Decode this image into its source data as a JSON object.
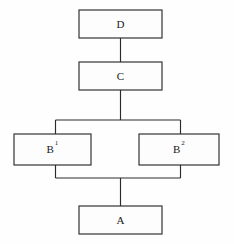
{
  "diagram": {
    "background_color": "#fefefe",
    "line_color": "#2b2b2b",
    "text_color": "#1a1a1a",
    "nodes": [
      {
        "id": "D",
        "label": "D",
        "superscript": "",
        "x": 79,
        "y": 10,
        "width": 83,
        "height": 28
      },
      {
        "id": "C",
        "label": "C",
        "superscript": "",
        "x": 79,
        "y": 62,
        "width": 83,
        "height": 28
      },
      {
        "id": "B1",
        "label": "B",
        "superscript": "1",
        "x": 14,
        "y": 134,
        "width": 77,
        "height": 31
      },
      {
        "id": "B2",
        "label": "B",
        "superscript": "2",
        "x": 139,
        "y": 134,
        "width": 80,
        "height": 31
      },
      {
        "id": "A",
        "label": "A",
        "superscript": "",
        "x": 79,
        "y": 206,
        "width": 83,
        "height": 28
      }
    ],
    "connectors": [
      {
        "name": "d-to-c",
        "from": "D",
        "to": "C",
        "path": "M 120.5 38 L 120.5 62"
      },
      {
        "name": "c-to-split",
        "from": "C",
        "to": "split-bar",
        "path": "M 120.5 90 L 120.5 120"
      },
      {
        "name": "split-bar-top",
        "from": "split-bar",
        "to": "B1-B2",
        "path": "M 55.5 120 L 180.5 120"
      },
      {
        "name": "split-left-down",
        "from": "split-bar",
        "to": "B1",
        "path": "M 55.5 120 L 55.5 134"
      },
      {
        "name": "split-right-down",
        "from": "split-bar",
        "to": "B2",
        "path": "M 180.5 120 L 180.5 134"
      },
      {
        "name": "merge-left-down",
        "from": "B1",
        "to": "merge-bar",
        "path": "M 55.5 165 L 55.5 178"
      },
      {
        "name": "merge-right-down",
        "from": "B2",
        "to": "merge-bar",
        "path": "M 180.5 165 L 180.5 178"
      },
      {
        "name": "merge-bar-bottom",
        "from": "B1-B2",
        "to": "merge-bar",
        "path": "M 55.5 178 L 180.5 178"
      },
      {
        "name": "merge-to-a",
        "from": "merge-bar",
        "to": "A",
        "path": "M 120.5 178 L 120.5 206"
      }
    ]
  }
}
